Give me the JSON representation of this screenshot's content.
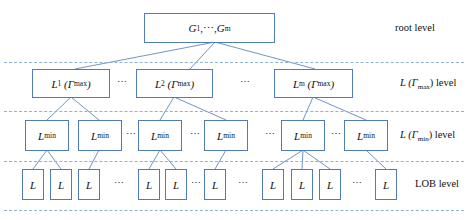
{
  "diagram": {
    "root": {
      "text": "G",
      "sub1": "1",
      "mid": ",⋯, ",
      "text2": "G",
      "sub2": "m"
    },
    "levels": {
      "root_label": "root level",
      "gmax_label_prefix": "L (",
      "gmax_label_gamma": "Γ",
      "gmax_label_sub": "max",
      "gmax_label_suffix": ")  level",
      "gmin_label_prefix": "L (",
      "gmin_label_gamma": "Γ",
      "gmin_label_sub": "min",
      "gmin_label_suffix": ")  level",
      "lob_label": "LOB level"
    },
    "level2_boxes": [
      {
        "name": "L",
        "index": "1",
        "gamma": "Γ",
        "sub": "max"
      },
      {
        "name": "L",
        "index": "2",
        "gamma": "Γ",
        "sub": "max"
      },
      {
        "name": "L",
        "index": "m",
        "gamma": "Γ",
        "sub": "max"
      }
    ],
    "level3_box": {
      "name": "L",
      "sub": "min"
    },
    "leaf_box": "L",
    "ellipsis": "⋯",
    "colors": {
      "box_border": "#4f7bbd",
      "edge": "#6f95c8",
      "dashed": "#8fb0d9"
    }
  }
}
